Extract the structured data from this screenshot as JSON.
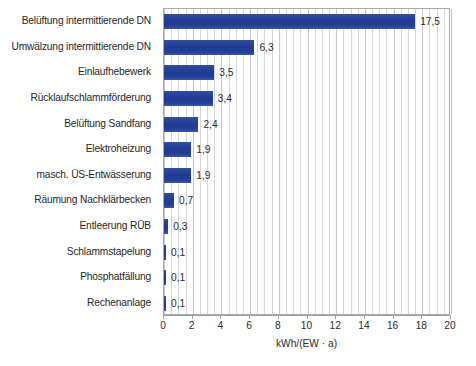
{
  "chart_data": {
    "type": "bar",
    "orientation": "horizontal",
    "title": "",
    "subtitle": "",
    "xlabel": "kWh/(EW · a)",
    "ylabel": "",
    "xlim": [
      0,
      20
    ],
    "xticks": [
      0,
      2,
      4,
      6,
      8,
      10,
      12,
      14,
      16,
      18,
      20
    ],
    "xtick_labels": [
      "0",
      "2",
      "4",
      "6",
      "8",
      "10",
      "12",
      "14",
      "16",
      "18",
      "20"
    ],
    "minor_tick_step": 0.5,
    "grid": "vertical-minor-and-major",
    "legend": "none",
    "bar_color": "#1f3a93",
    "categories": [
      "Belüftung intermittierende DN",
      "Umwälzung intermittierende DN",
      "Einlaufhebewerk",
      "Rücklaufschlammförderung",
      "Belüftung Sandfang",
      "Elektroheizung",
      "masch. ÜS-Entwässerung",
      "Räumung Nachklärbecken",
      "Entleerung RÜB",
      "Schlammstapelung",
      "Phosphatfällung",
      "Rechenanlage"
    ],
    "values": [
      17.5,
      6.3,
      3.5,
      3.4,
      2.4,
      1.9,
      1.9,
      0.7,
      0.3,
      0.1,
      0.1,
      0.1
    ],
    "value_labels": [
      "17,5",
      "6,3",
      "3,5",
      "3,4",
      "2,4",
      "1,9",
      "1,9",
      "0,7",
      "0,3",
      "0,1",
      "0,1",
      "0,1"
    ]
  }
}
